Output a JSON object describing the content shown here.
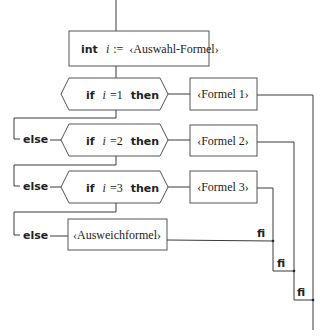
{
  "diagram": {
    "type": "structogram-flowchart",
    "assign": {
      "kw": "int",
      "var": "i",
      "op": ":=",
      "expr": "‹Auswahl-Formel›"
    },
    "branches": [
      {
        "prefix": "",
        "if_kw": "if",
        "var": "i",
        "cond": "=1",
        "then_kw": "then",
        "body": "‹Formel 1›"
      },
      {
        "prefix": "else",
        "if_kw": "if",
        "var": "i",
        "cond": "=2",
        "then_kw": "then",
        "body": "‹Formel 2›"
      },
      {
        "prefix": "else",
        "if_kw": "if",
        "var": "i",
        "cond": "=3",
        "then_kw": "then",
        "body": "‹Formel 3›"
      }
    ],
    "fallback": {
      "prefix": "else",
      "body": "‹Ausweichformel›"
    },
    "closers": [
      "fi",
      "fi",
      "fi"
    ]
  }
}
